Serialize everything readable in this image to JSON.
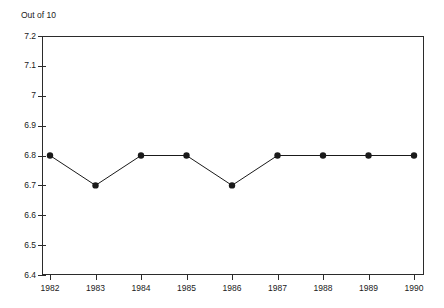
{
  "chart_data": {
    "type": "line",
    "title": "",
    "subtitle": "",
    "xlabel": "",
    "ylabel": "Out of 10",
    "categories": [
      "1982",
      "1983",
      "1984",
      "1985",
      "1986",
      "1987",
      "1988",
      "1989",
      "1990"
    ],
    "values": [
      6.8,
      6.7,
      6.8,
      6.8,
      6.7,
      6.8,
      6.8,
      6.8,
      6.8
    ],
    "x": [
      1982,
      1983,
      1984,
      1985,
      1986,
      1987,
      1988,
      1989,
      1990
    ],
    "ylim": [
      6.4,
      7.2
    ],
    "ytick_labels": [
      "7.2",
      "7.1",
      "7",
      "6.9",
      "6.8",
      "6.7",
      "6.6",
      "6.5",
      "6.4"
    ],
    "ytick_values": [
      7.2,
      7.1,
      7.0,
      6.9,
      6.8,
      6.7,
      6.6,
      6.5,
      6.4
    ],
    "xtick_labels": [
      "1982",
      "1983",
      "1984",
      "1985",
      "1986",
      "1987",
      "1988",
      "1989",
      "1990"
    ],
    "grid": false,
    "legend": false,
    "legend_position": "none",
    "marker": "filled-circle",
    "line_color": "#1a1a1a",
    "marker_color": "#1a1a1a",
    "axis_color": "#2b2b2b",
    "background_color": "#ffffff"
  }
}
